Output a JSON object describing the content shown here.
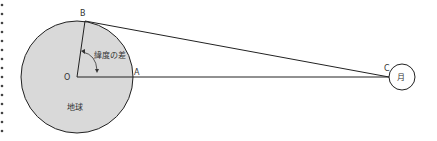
{
  "diagram": {
    "labels": {
      "B": "B",
      "O": "O",
      "A": "A",
      "C": "C",
      "moon": "月",
      "earth": "地球",
      "latitude_diff": "緯度の差"
    },
    "colors": {
      "earth_fill": "#d9d9d9",
      "stroke": "#222222",
      "dots": "#444444"
    }
  }
}
